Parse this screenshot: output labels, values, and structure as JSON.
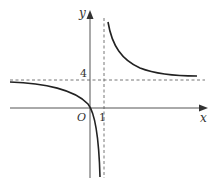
{
  "diagram": {
    "type": "function-graph",
    "axes": {
      "x_label": "x",
      "y_label": "y",
      "origin_label": "O"
    },
    "tick_labels": {
      "x_tick": "1",
      "y_tick": "4"
    },
    "asymptotes": {
      "vertical": "x = 1",
      "horizontal": "y = 4"
    },
    "curve": {
      "description": "hyperbola with two branches; left branch passes through origin and descends toward x=1; right branch descends from top toward y=4"
    },
    "colors": {
      "axis": "#555555",
      "curve": "#222222",
      "dashed": "#666666"
    }
  }
}
